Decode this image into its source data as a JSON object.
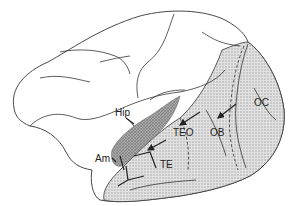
{
  "diagram": {
    "labels": {
      "hip": "Hip",
      "am": "Am",
      "teo": "TEO",
      "te": "TE",
      "ob": "OB",
      "oc": "OC"
    },
    "colors": {
      "outline": "#333333",
      "shaded_region": "#d4d4d4",
      "dark_region": "#9a9a9a",
      "background": "#ffffff"
    }
  }
}
